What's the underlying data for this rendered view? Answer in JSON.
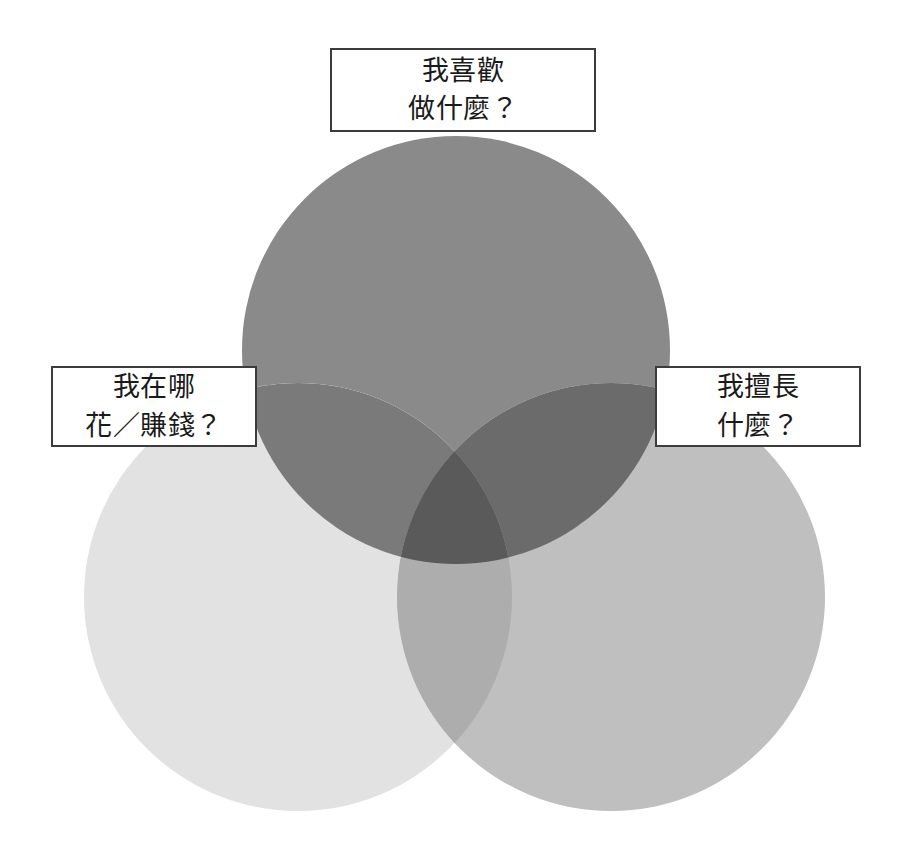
{
  "diagram": {
    "type": "venn-3-circle",
    "background_color": "#ffffff",
    "canvas": {
      "width": 905,
      "height": 862
    },
    "circles": [
      {
        "id": "top",
        "name": "interest-circle",
        "cx": 456,
        "cy": 350,
        "r": 214,
        "fill": "#8a8a8a"
      },
      {
        "id": "bottom-left",
        "name": "money-circle",
        "cx": 298,
        "cy": 597,
        "r": 214,
        "fill": "#e2e2e2"
      },
      {
        "id": "bottom-right",
        "name": "skill-circle",
        "cx": 611,
        "cy": 597,
        "r": 214,
        "fill": "#bfbfbf"
      }
    ],
    "overlap_colors": {
      "top_and_bottom_left": "#7a7a7a",
      "top_and_bottom_right": "#6b6b6b",
      "bottom_left_and_bottom_right": "#adadad",
      "all_three": "#5a5a5a"
    },
    "label_border_color": "#3c3c3c",
    "label_background_color": "#ffffff",
    "label_text_color": "#1a1a1a"
  },
  "labels": {
    "top": {
      "line1": "我喜歡",
      "line2": "做什麼？"
    },
    "left": {
      "line1": "我在哪",
      "line2": "花／賺錢？"
    },
    "right": {
      "line1": "我擅長",
      "line2": "什麼？"
    }
  }
}
